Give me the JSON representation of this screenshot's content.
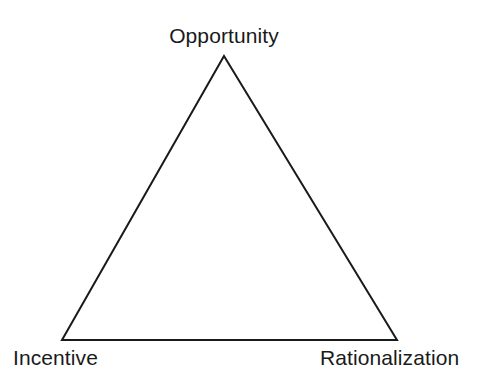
{
  "diagram": {
    "type": "triangle-diagram",
    "background_color": "#ffffff",
    "stroke_color": "#1a1a1a",
    "stroke_width": 2,
    "fill": "none",
    "text_color": "#1a1a1a",
    "vertices": [
      {
        "id": "apex",
        "label": "Opportunity",
        "x": 224,
        "y": 56,
        "label_position": "above"
      },
      {
        "id": "bottom-left",
        "label": "Incentive",
        "x": 62,
        "y": 340,
        "label_position": "below-left"
      },
      {
        "id": "bottom-right",
        "label": "Rationalization",
        "x": 397,
        "y": 340,
        "label_position": "below-right"
      }
    ],
    "edges": [
      {
        "id": "left-edge",
        "from": "apex",
        "to": "bottom-left"
      },
      {
        "id": "right-edge",
        "from": "apex",
        "to": "bottom-right"
      },
      {
        "id": "bottom-edge",
        "from": "bottom-left",
        "to": "bottom-right"
      }
    ],
    "points_path": "224,56 397,340 62,340",
    "labels": {
      "apex": "Opportunity",
      "bottom_left": "Incentive",
      "bottom_right": "Rationalization"
    }
  }
}
